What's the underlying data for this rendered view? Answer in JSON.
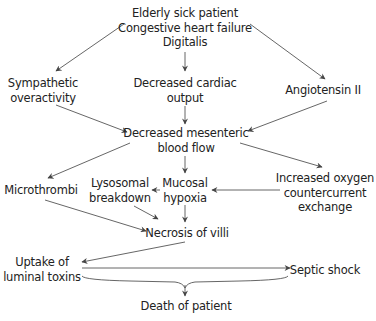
{
  "diagram": {
    "type": "flowchart",
    "nodes": {
      "origin": {
        "lines": [
          "Elderly sick patient",
          "Congestive heart failure",
          "Digitalis"
        ]
      },
      "sympathetic": {
        "lines": [
          "Sympathetic",
          "overactivity"
        ]
      },
      "cardiac_output": {
        "lines": [
          "Decreased cardiac",
          "output"
        ]
      },
      "angiotensin": {
        "lines": [
          "Angiotensin II"
        ]
      },
      "mesenteric_flow": {
        "lines": [
          "Decreased mesenteric",
          "blood flow"
        ]
      },
      "microthrombi": {
        "lines": [
          "Microthrombi"
        ]
      },
      "lysosomal": {
        "lines": [
          "Lysosomal",
          "breakdown"
        ]
      },
      "hypoxia": {
        "lines": [
          "Mucosal",
          "hypoxia"
        ]
      },
      "oxygen_exchange": {
        "lines": [
          "Increased oxygen",
          "countercurrent",
          "exchange"
        ]
      },
      "necrosis": {
        "lines": [
          "Necrosis of villi"
        ]
      },
      "toxins": {
        "lines": [
          "Uptake of",
          "luminal toxins"
        ]
      },
      "septic": {
        "lines": [
          "Septic shock"
        ]
      },
      "death": {
        "lines": [
          "Death of patient"
        ]
      }
    },
    "edges": [
      {
        "from": "origin",
        "to": "sympathetic"
      },
      {
        "from": "origin",
        "to": "cardiac_output"
      },
      {
        "from": "origin",
        "to": "angiotensin"
      },
      {
        "from": "sympathetic",
        "to": "mesenteric_flow"
      },
      {
        "from": "cardiac_output",
        "to": "mesenteric_flow"
      },
      {
        "from": "angiotensin",
        "to": "mesenteric_flow"
      },
      {
        "from": "mesenteric_flow",
        "to": "microthrombi"
      },
      {
        "from": "mesenteric_flow",
        "to": "hypoxia"
      },
      {
        "from": "mesenteric_flow",
        "to": "oxygen_exchange"
      },
      {
        "from": "oxygen_exchange",
        "to": "hypoxia"
      },
      {
        "from": "hypoxia",
        "to": "lysosomal"
      },
      {
        "from": "microthrombi",
        "to": "necrosis"
      },
      {
        "from": "lysosomal",
        "to": "necrosis"
      },
      {
        "from": "hypoxia",
        "to": "necrosis"
      },
      {
        "from": "necrosis",
        "to": "toxins"
      },
      {
        "from": "toxins",
        "to": "septic"
      },
      {
        "from": "toxins",
        "to": "death"
      },
      {
        "from": "septic",
        "to": "death"
      }
    ],
    "colors": {
      "text": "#222222",
      "line": "#555555",
      "background": "#ffffff"
    }
  }
}
